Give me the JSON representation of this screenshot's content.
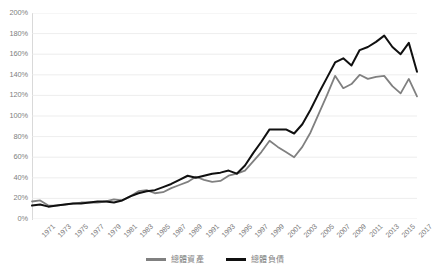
{
  "chart_data": {
    "type": "line",
    "title": "",
    "subtitle": "",
    "xlabel": "",
    "ylabel": "",
    "grid": true,
    "legend_position": "bottom",
    "ylim": [
      0,
      200
    ],
    "ytick_step": 20,
    "ytick_labels": [
      "200%",
      "180%",
      "160%",
      "140%",
      "120%",
      "100%",
      "80%",
      "60%",
      "40%",
      "20%",
      "0%"
    ],
    "ytick_values": [
      200,
      180,
      160,
      140,
      120,
      100,
      80,
      60,
      40,
      20,
      0
    ],
    "x": [
      1971,
      1972,
      1973,
      1974,
      1975,
      1976,
      1977,
      1978,
      1979,
      1980,
      1981,
      1982,
      1983,
      1984,
      1985,
      1986,
      1987,
      1988,
      1989,
      1990,
      1991,
      1992,
      1993,
      1994,
      1995,
      1996,
      1997,
      1998,
      1999,
      2000,
      2001,
      2002,
      2003,
      2004,
      2005,
      2006,
      2007,
      2008,
      2009,
      2010,
      2011,
      2012,
      2013,
      2014,
      2015,
      2016,
      2017,
      2018
    ],
    "xtick_labels": [
      "1971",
      "1973",
      "1975",
      "1977",
      "1979",
      "1981",
      "1983",
      "1985",
      "1987",
      "1989",
      "1991",
      "1993",
      "1995",
      "1997",
      "1999",
      "2001",
      "2003",
      "2005",
      "2007",
      "2009",
      "2011",
      "2013",
      "2015",
      "2017"
    ],
    "series": [
      {
        "name": "總體資產",
        "color": "#808080",
        "values": [
          17,
          18,
          13,
          13,
          14,
          15,
          16,
          16,
          16,
          17,
          19,
          18,
          22,
          27,
          28,
          25,
          26,
          30,
          33,
          36,
          41,
          38,
          36,
          37,
          42,
          44,
          47,
          56,
          65,
          76,
          70,
          65,
          60,
          70,
          84,
          102,
          120,
          139,
          127,
          131,
          140,
          136,
          138,
          139,
          129,
          122,
          136,
          119
        ]
      },
      {
        "name": "總體負債",
        "color": "#101010",
        "values": [
          13,
          14,
          12,
          13,
          14,
          15,
          15,
          16,
          17,
          17,
          16,
          18,
          22,
          25,
          27,
          28,
          31,
          34,
          38,
          42,
          40,
          42,
          44,
          45,
          47,
          44,
          52,
          64,
          75,
          87,
          87,
          87,
          83,
          92,
          106,
          122,
          137,
          152,
          156,
          149,
          164,
          167,
          172,
          178,
          167,
          160,
          171,
          143
        ]
      }
    ]
  },
  "legend": {
    "items": [
      {
        "label": "總體資產",
        "color": "#808080"
      },
      {
        "label": "總體負債",
        "color": "#101010"
      }
    ]
  }
}
